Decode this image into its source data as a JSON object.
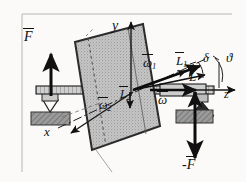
{
  "figure": {
    "kind": "physics-mechanics-diagram",
    "background": "#fbfaf8",
    "ink": "#111111",
    "disc_fill": "#b9b9b9",
    "block_fill": "#8d8d8d",
    "frame": {
      "present": true,
      "sides": "left-top"
    }
  },
  "axes": {
    "y": {
      "label": "y",
      "direction": "up"
    },
    "x": {
      "label": "x",
      "direction": "down-left"
    },
    "z": {
      "label": "z",
      "direction": "right"
    }
  },
  "forces": {
    "up": {
      "label": "F",
      "overbar": true,
      "sign": "",
      "direction": "up"
    },
    "down": {
      "label": "F",
      "overbar": true,
      "sign": "-",
      "direction": "down"
    }
  },
  "angular_velocity": {
    "spin": {
      "label": "ω",
      "overbar": true,
      "sub": ""
    },
    "omega1": {
      "label": "ω",
      "overbar": true,
      "sub": "1"
    },
    "omega2": {
      "label": "ω",
      "overbar": true,
      "sub": "2"
    }
  },
  "angular_momentum": {
    "total": {
      "label": "L",
      "overbar": true,
      "sub": ""
    },
    "l1": {
      "label": "L",
      "overbar": true,
      "sub": "1"
    },
    "l2": {
      "label": "L",
      "overbar": true,
      "sub": "2"
    }
  },
  "angles": {
    "delta": {
      "label": "δ"
    },
    "theta": {
      "label": "ϑ"
    }
  }
}
